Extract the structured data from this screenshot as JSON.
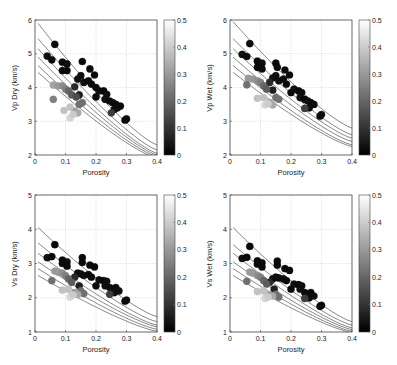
{
  "chart_data": [
    {
      "type": "scatter",
      "title": "",
      "xlabel": "Porosity",
      "ylabel": "Vp Dry (km/s)",
      "xlim": [
        0,
        0.4
      ],
      "ylim": [
        2,
        6
      ],
      "xticks": [
        "0",
        "0.1",
        "0.2",
        "0.3",
        "0.4"
      ],
      "yticks": [
        "2",
        "3",
        "4",
        "5",
        "6"
      ],
      "grid": true,
      "colorbar": {
        "min": 0,
        "max": 0.5,
        "ticks": [
          "0",
          "0.1",
          "0.2",
          "0.3",
          "0.4",
          "0.5"
        ],
        "colormap": "gray"
      },
      "model_curves": [
        {
          "start": 5.9,
          "end": 2.3
        },
        {
          "start": 5.45,
          "end": 2.15
        },
        {
          "start": 5.15,
          "end": 2.05
        },
        {
          "start": 4.9,
          "end": 2.0
        },
        {
          "start": 4.65,
          "end": 1.95
        },
        {
          "start": 4.45,
          "end": 1.9
        }
      ],
      "points": [
        [
          0.065,
          5.28,
          0.02
        ],
        [
          0.04,
          4.93,
          0.03
        ],
        [
          0.055,
          4.82,
          0.02
        ],
        [
          0.09,
          4.75,
          0.02
        ],
        [
          0.105,
          4.7,
          0.03
        ],
        [
          0.09,
          4.5,
          0.02
        ],
        [
          0.105,
          4.5,
          0.02
        ],
        [
          0.155,
          4.77,
          0.02
        ],
        [
          0.18,
          4.55,
          0.02
        ],
        [
          0.195,
          4.37,
          0.02
        ],
        [
          0.15,
          4.35,
          0.03
        ],
        [
          0.14,
          4.25,
          0.03
        ],
        [
          0.16,
          4.15,
          0.03
        ],
        [
          0.175,
          4.2,
          0.02
        ],
        [
          0.185,
          4.1,
          0.02
        ],
        [
          0.2,
          4.0,
          0.02
        ],
        [
          0.21,
          3.9,
          0.03
        ],
        [
          0.225,
          3.9,
          0.02
        ],
        [
          0.235,
          3.8,
          0.03
        ],
        [
          0.2,
          3.72,
          0.02
        ],
        [
          0.23,
          3.65,
          0.03
        ],
        [
          0.245,
          3.6,
          0.02
        ],
        [
          0.255,
          3.55,
          0.03
        ],
        [
          0.265,
          3.5,
          0.02
        ],
        [
          0.27,
          3.4,
          0.03
        ],
        [
          0.28,
          3.45,
          0.02
        ],
        [
          0.26,
          3.35,
          0.03
        ],
        [
          0.25,
          3.25,
          0.12
        ],
        [
          0.3,
          3.07,
          0.03
        ],
        [
          0.295,
          3.03,
          0.02
        ],
        [
          0.13,
          4.02,
          0.08
        ],
        [
          0.145,
          3.78,
          0.06
        ],
        [
          0.06,
          4.07,
          0.32
        ],
        [
          0.075,
          4.05,
          0.3
        ],
        [
          0.09,
          4.05,
          0.28
        ],
        [
          0.1,
          3.95,
          0.25
        ],
        [
          0.11,
          3.9,
          0.2
        ],
        [
          0.12,
          3.78,
          0.18
        ],
        [
          0.135,
          3.72,
          0.15
        ],
        [
          0.06,
          3.65,
          0.25
        ],
        [
          0.145,
          3.5,
          0.22
        ],
        [
          0.155,
          3.55,
          0.22
        ],
        [
          0.13,
          3.3,
          0.3
        ],
        [
          0.14,
          3.25,
          0.33
        ],
        [
          0.095,
          3.32,
          0.38
        ],
        [
          0.115,
          3.42,
          0.38
        ],
        [
          0.115,
          3.1,
          0.42
        ],
        [
          0.125,
          3.2,
          0.4
        ]
      ]
    },
    {
      "type": "scatter",
      "title": "",
      "xlabel": "Porosity",
      "ylabel": "Vp Wet (km/s)",
      "xlim": [
        0,
        0.4
      ],
      "ylim": [
        2,
        6
      ],
      "xticks": [
        "0",
        "0.1",
        "0.2",
        "0.3",
        "0.4"
      ],
      "yticks": [
        "2",
        "3",
        "4",
        "5",
        "6"
      ],
      "grid": true,
      "colorbar": {
        "min": 0,
        "max": 0.5,
        "ticks": [
          "0",
          "0.1",
          "0.2",
          "0.3",
          "0.4",
          "0.5"
        ],
        "colormap": "gray"
      },
      "model_curves": [
        {
          "start": 5.95,
          "end": 2.8
        },
        {
          "start": 5.45,
          "end": 2.6
        },
        {
          "start": 5.15,
          "end": 2.5
        },
        {
          "start": 4.9,
          "end": 2.4
        },
        {
          "start": 4.65,
          "end": 2.3
        },
        {
          "start": 4.45,
          "end": 2.25
        }
      ],
      "points": [
        [
          0.065,
          5.3,
          0.02
        ],
        [
          0.04,
          4.98,
          0.03
        ],
        [
          0.055,
          4.92,
          0.02
        ],
        [
          0.09,
          4.78,
          0.02
        ],
        [
          0.105,
          4.72,
          0.03
        ],
        [
          0.09,
          4.6,
          0.02
        ],
        [
          0.105,
          4.55,
          0.02
        ],
        [
          0.15,
          4.72,
          0.02
        ],
        [
          0.155,
          4.6,
          0.02
        ],
        [
          0.18,
          4.52,
          0.02
        ],
        [
          0.195,
          4.37,
          0.02
        ],
        [
          0.15,
          4.35,
          0.03
        ],
        [
          0.14,
          4.28,
          0.03
        ],
        [
          0.16,
          4.2,
          0.03
        ],
        [
          0.175,
          4.25,
          0.02
        ],
        [
          0.185,
          4.1,
          0.02
        ],
        [
          0.2,
          3.85,
          0.02
        ],
        [
          0.21,
          3.95,
          0.03
        ],
        [
          0.225,
          3.9,
          0.02
        ],
        [
          0.235,
          3.85,
          0.03
        ],
        [
          0.23,
          3.7,
          0.03
        ],
        [
          0.245,
          3.65,
          0.02
        ],
        [
          0.255,
          3.6,
          0.03
        ],
        [
          0.265,
          3.55,
          0.02
        ],
        [
          0.275,
          3.5,
          0.03
        ],
        [
          0.26,
          3.4,
          0.03
        ],
        [
          0.245,
          3.38,
          0.12
        ],
        [
          0.3,
          3.2,
          0.03
        ],
        [
          0.295,
          3.15,
          0.02
        ],
        [
          0.13,
          4.15,
          0.08
        ],
        [
          0.14,
          3.92,
          0.06
        ],
        [
          0.06,
          4.27,
          0.3
        ],
        [
          0.075,
          4.25,
          0.3
        ],
        [
          0.09,
          4.2,
          0.28
        ],
        [
          0.1,
          4.15,
          0.25
        ],
        [
          0.11,
          4.05,
          0.2
        ],
        [
          0.12,
          3.95,
          0.18
        ],
        [
          0.055,
          4.08,
          0.22
        ],
        [
          0.15,
          3.7,
          0.22
        ],
        [
          0.16,
          3.65,
          0.22
        ],
        [
          0.13,
          3.55,
          0.3
        ],
        [
          0.14,
          3.48,
          0.33
        ],
        [
          0.09,
          3.68,
          0.38
        ],
        [
          0.11,
          3.7,
          0.38
        ],
        [
          0.115,
          3.48,
          0.42
        ],
        [
          0.125,
          3.52,
          0.4
        ]
      ]
    },
    {
      "type": "scatter",
      "title": "",
      "xlabel": "Porosity",
      "ylabel": "Vs Dry (km/s)",
      "xlim": [
        0,
        0.4
      ],
      "ylim": [
        1,
        5
      ],
      "xticks": [
        "0",
        "0.1",
        "0.2",
        "0.3",
        "0.4"
      ],
      "yticks": [
        "1",
        "2",
        "3",
        "4",
        "5"
      ],
      "grid": true,
      "colorbar": {
        "min": 0,
        "max": 0.5,
        "ticks": [
          "0",
          "0.1",
          "0.2",
          "0.3",
          "0.4",
          "0.5"
        ],
        "colormap": "gray"
      },
      "model_curves": [
        {
          "start": 4.05,
          "end": 1.45
        },
        {
          "start": 3.6,
          "end": 1.3
        },
        {
          "start": 3.3,
          "end": 1.2
        },
        {
          "start": 3.05,
          "end": 1.15
        },
        {
          "start": 2.85,
          "end": 1.08
        },
        {
          "start": 2.65,
          "end": 1.02
        }
      ],
      "points": [
        [
          0.065,
          3.55,
          0.02
        ],
        [
          0.04,
          3.17,
          0.03
        ],
        [
          0.055,
          3.2,
          0.02
        ],
        [
          0.09,
          3.1,
          0.02
        ],
        [
          0.105,
          3.05,
          0.03
        ],
        [
          0.09,
          3.0,
          0.02
        ],
        [
          0.105,
          2.92,
          0.02
        ],
        [
          0.155,
          3.17,
          0.02
        ],
        [
          0.155,
          3.03,
          0.02
        ],
        [
          0.18,
          2.95,
          0.02
        ],
        [
          0.195,
          2.9,
          0.02
        ],
        [
          0.14,
          2.72,
          0.03
        ],
        [
          0.15,
          2.7,
          0.03
        ],
        [
          0.16,
          2.65,
          0.03
        ],
        [
          0.175,
          2.68,
          0.02
        ],
        [
          0.185,
          2.6,
          0.02
        ],
        [
          0.2,
          2.35,
          0.02
        ],
        [
          0.21,
          2.52,
          0.03
        ],
        [
          0.225,
          2.5,
          0.02
        ],
        [
          0.235,
          2.48,
          0.03
        ],
        [
          0.23,
          2.35,
          0.03
        ],
        [
          0.245,
          2.3,
          0.02
        ],
        [
          0.255,
          2.25,
          0.03
        ],
        [
          0.265,
          2.3,
          0.02
        ],
        [
          0.275,
          2.2,
          0.03
        ],
        [
          0.26,
          2.15,
          0.03
        ],
        [
          0.245,
          2.1,
          0.12
        ],
        [
          0.3,
          1.93,
          0.03
        ],
        [
          0.295,
          1.9,
          0.02
        ],
        [
          0.13,
          2.6,
          0.08
        ],
        [
          0.145,
          2.35,
          0.06
        ],
        [
          0.065,
          2.78,
          0.3
        ],
        [
          0.075,
          2.75,
          0.3
        ],
        [
          0.09,
          2.72,
          0.28
        ],
        [
          0.1,
          2.65,
          0.25
        ],
        [
          0.11,
          2.55,
          0.2
        ],
        [
          0.12,
          2.45,
          0.18
        ],
        [
          0.055,
          2.5,
          0.22
        ],
        [
          0.15,
          2.2,
          0.22
        ],
        [
          0.16,
          2.12,
          0.22
        ],
        [
          0.13,
          2.15,
          0.3
        ],
        [
          0.14,
          2.1,
          0.33
        ],
        [
          0.09,
          2.22,
          0.38
        ],
        [
          0.11,
          2.25,
          0.38
        ],
        [
          0.115,
          2.02,
          0.42
        ],
        [
          0.125,
          2.08,
          0.4
        ]
      ]
    },
    {
      "type": "scatter",
      "title": "",
      "xlabel": "Porosity",
      "ylabel": "Vs Wet (km/s)",
      "xlim": [
        0,
        0.4
      ],
      "ylim": [
        1,
        5
      ],
      "xticks": [
        "0",
        "0.1",
        "0.2",
        "0.3",
        "0.4"
      ],
      "yticks": [
        "1",
        "2",
        "3",
        "4",
        "5"
      ],
      "grid": true,
      "colorbar": {
        "min": 0,
        "max": 0.5,
        "ticks": [
          "0",
          "0.1",
          "0.2",
          "0.3",
          "0.4",
          "0.5"
        ],
        "colormap": "gray"
      },
      "model_curves": [
        {
          "start": 4.05,
          "end": 1.3
        },
        {
          "start": 3.55,
          "end": 1.2
        },
        {
          "start": 3.3,
          "end": 1.12
        },
        {
          "start": 3.05,
          "end": 1.07
        },
        {
          "start": 2.85,
          "end": 1.02
        },
        {
          "start": 2.65,
          "end": 0.98
        }
      ],
      "points": [
        [
          0.065,
          3.5,
          0.02
        ],
        [
          0.04,
          3.15,
          0.03
        ],
        [
          0.055,
          3.18,
          0.02
        ],
        [
          0.09,
          3.08,
          0.02
        ],
        [
          0.105,
          3.02,
          0.03
        ],
        [
          0.09,
          2.98,
          0.02
        ],
        [
          0.105,
          2.9,
          0.02
        ],
        [
          0.155,
          3.07,
          0.02
        ],
        [
          0.155,
          2.95,
          0.02
        ],
        [
          0.18,
          2.85,
          0.02
        ],
        [
          0.195,
          2.8,
          0.02
        ],
        [
          0.14,
          2.55,
          0.03
        ],
        [
          0.15,
          2.6,
          0.03
        ],
        [
          0.16,
          2.58,
          0.03
        ],
        [
          0.175,
          2.55,
          0.02
        ],
        [
          0.185,
          2.5,
          0.02
        ],
        [
          0.2,
          2.25,
          0.02
        ],
        [
          0.21,
          2.4,
          0.03
        ],
        [
          0.225,
          2.38,
          0.02
        ],
        [
          0.235,
          2.35,
          0.03
        ],
        [
          0.23,
          2.25,
          0.03
        ],
        [
          0.245,
          2.15,
          0.02
        ],
        [
          0.255,
          2.1,
          0.03
        ],
        [
          0.265,
          2.15,
          0.02
        ],
        [
          0.275,
          2.05,
          0.03
        ],
        [
          0.26,
          2.0,
          0.03
        ],
        [
          0.245,
          1.98,
          0.12
        ],
        [
          0.3,
          1.78,
          0.03
        ],
        [
          0.295,
          1.75,
          0.02
        ],
        [
          0.13,
          2.45,
          0.08
        ],
        [
          0.145,
          2.25,
          0.06
        ],
        [
          0.065,
          2.75,
          0.3
        ],
        [
          0.075,
          2.72,
          0.3
        ],
        [
          0.09,
          2.65,
          0.28
        ],
        [
          0.1,
          2.6,
          0.25
        ],
        [
          0.11,
          2.5,
          0.2
        ],
        [
          0.12,
          2.4,
          0.18
        ],
        [
          0.055,
          2.48,
          0.22
        ],
        [
          0.15,
          2.1,
          0.22
        ],
        [
          0.16,
          2.02,
          0.22
        ],
        [
          0.13,
          2.08,
          0.3
        ],
        [
          0.14,
          2.05,
          0.33
        ],
        [
          0.09,
          2.18,
          0.38
        ],
        [
          0.11,
          2.2,
          0.38
        ],
        [
          0.115,
          1.98,
          0.42
        ],
        [
          0.125,
          2.02,
          0.4
        ]
      ]
    }
  ],
  "panels": [
    {
      "ylabel": "Vp Dry (km/s)",
      "xlabel": "Porosity"
    },
    {
      "ylabel": "Vp Wet (km/s)",
      "xlabel": "Porosity"
    },
    {
      "ylabel": "Vs Dry (km/s)",
      "xlabel": "Porosity"
    },
    {
      "ylabel": "Vs Wet (km/s)",
      "xlabel": "Porosity"
    }
  ]
}
